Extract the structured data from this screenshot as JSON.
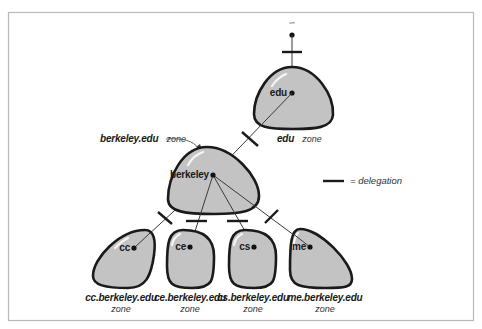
{
  "diagram": {
    "root": {
      "label": "“”"
    },
    "nodes": {
      "edu": {
        "label": "edu",
        "zone_name": "edu",
        "zone_word": "zone"
      },
      "berkeley": {
        "label": "berkeley",
        "zone_name": "berkeley.edu",
        "zone_word": "zone"
      },
      "cc": {
        "label": "cc",
        "zone_name": "cc.berkeley.edu",
        "zone_word": "zone"
      },
      "ce": {
        "label": "ce",
        "zone_name": "ce.berkeley.edu",
        "zone_word": "zone"
      },
      "cs": {
        "label": "cs",
        "zone_name": "cs.berkeley.edu",
        "zone_word": "zone"
      },
      "me": {
        "label": "me",
        "zone_name": "me.berkeley.edu",
        "zone_word": "zone"
      }
    },
    "edges": [
      {
        "from": "root",
        "to": "edu",
        "delegation": true
      },
      {
        "from": "edu",
        "to": "berkeley",
        "delegation": true
      },
      {
        "from": "berkeley",
        "to": "cc",
        "delegation": true
      },
      {
        "from": "berkeley",
        "to": "ce",
        "delegation": true
      },
      {
        "from": "berkeley",
        "to": "cs",
        "delegation": true
      },
      {
        "from": "berkeley",
        "to": "me",
        "delegation": true
      }
    ],
    "legend": {
      "text": "= delegation"
    },
    "colors": {
      "zone_fill": "#c3c3c3",
      "zone_stroke": "#1a1a1a",
      "frame": "#b9b9b9"
    }
  }
}
